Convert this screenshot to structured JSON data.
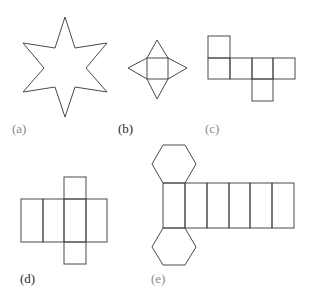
{
  "figures": [
    {
      "id": "a",
      "label": "(a)",
      "description": "six-pointed star outline"
    },
    {
      "id": "b",
      "label": "(b)",
      "description": "square pyramid net"
    },
    {
      "id": "c",
      "label": "(c)",
      "description": "cube net"
    },
    {
      "id": "d",
      "label": "(d)",
      "description": "rectangular prism net"
    },
    {
      "id": "e",
      "label": "(e)",
      "description": "hexagonal prism net"
    }
  ],
  "colors": {
    "stroke": "#4a4a4a",
    "label_light": "#8a8a8a",
    "label_dark": "#2a2a2a"
  }
}
